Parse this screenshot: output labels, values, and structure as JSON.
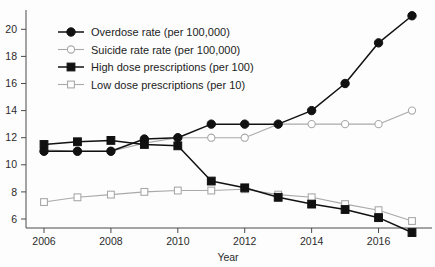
{
  "chart_data": {
    "type": "line",
    "title": "",
    "xlabel": "Year",
    "ylabel": "",
    "x": [
      2006,
      2007,
      2008,
      2009,
      2010,
      2011,
      2012,
      2013,
      2014,
      2015,
      2016,
      2017
    ],
    "xlim": [
      2006,
      2017
    ],
    "ylim": [
      5,
      21.3
    ],
    "x_tick_labels": [
      "2006",
      "2008",
      "2010",
      "2012",
      "2014",
      "2016"
    ],
    "x_tick_values": [
      2006,
      2008,
      2010,
      2012,
      2014,
      2016
    ],
    "y_tick_labels": [
      "6",
      "8",
      "10",
      "12",
      "14",
      "16",
      "18",
      "20"
    ],
    "y_tick_values": [
      6,
      8,
      10,
      12,
      14,
      16,
      18,
      20
    ],
    "grid": false,
    "legend_position": "upper left",
    "series": [
      {
        "name": "Overdose rate (per 100,000)",
        "marker": "filled-circle",
        "color": "#111111",
        "values": [
          11.0,
          11.0,
          11.0,
          11.9,
          12.0,
          13.0,
          13.0,
          13.0,
          14.0,
          16.0,
          19.0,
          21.0
        ]
      },
      {
        "name": "Suicide rate rate (per 100,000)",
        "marker": "open-circle",
        "color": "#a9a9a9",
        "values": [
          11.1,
          11.0,
          11.0,
          11.6,
          12.0,
          12.0,
          12.0,
          13.0,
          13.0,
          13.0,
          13.0,
          14.0
        ]
      },
      {
        "name": "High dose prescriptions (per 100)",
        "marker": "filled-square",
        "color": "#111111",
        "values": [
          11.5,
          11.7,
          11.8,
          11.5,
          11.4,
          8.8,
          8.3,
          7.6,
          7.1,
          6.7,
          6.1,
          5.0
        ]
      },
      {
        "name": "Low dose prescriptions (per 10)",
        "marker": "open-square",
        "color": "#a9a9a9",
        "values": [
          7.25,
          7.6,
          7.8,
          8.0,
          8.1,
          8.1,
          8.2,
          7.8,
          7.6,
          7.1,
          6.65,
          5.85
        ]
      }
    ]
  },
  "axes": {
    "x_axis_title": "Year"
  }
}
